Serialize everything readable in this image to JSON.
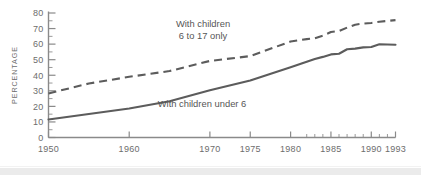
{
  "chart_data": {
    "type": "line",
    "title": "",
    "subtitle": "",
    "xlabel": "",
    "ylabel": "PERCENTAGE",
    "xlim": [
      1950,
      1993
    ],
    "ylim": [
      0,
      80
    ],
    "grid": false,
    "legend_position": "inline-annotations",
    "y_ticks": [
      0,
      10,
      20,
      30,
      40,
      50,
      60,
      70,
      80
    ],
    "y_tick_labels": [
      "0",
      "10",
      "20",
      "30",
      "40",
      "50",
      "60",
      "70",
      "80"
    ],
    "y_minor_ticks": [
      5,
      15,
      25,
      35,
      45,
      55,
      65,
      75
    ],
    "x_ticks": [
      1950,
      1960,
      1970,
      1975,
      1980,
      1985,
      1990,
      1993
    ],
    "x_tick_labels": [
      "1950",
      "1960",
      "1970",
      "1975",
      "1980",
      "1985",
      "1990",
      "1993"
    ],
    "x_minor_ticks": [
      1982,
      1983,
      1984,
      1986,
      1987,
      1988,
      1989,
      1991,
      1992
    ],
    "series": [
      {
        "name": "With children 6 to 17 only",
        "style": "dashed",
        "color": "#5c5c5c",
        "x": [
          1950,
          1955,
          1960,
          1965,
          1970,
          1975,
          1980,
          1982,
          1983,
          1984,
          1985,
          1986,
          1987,
          1988,
          1989,
          1990,
          1991,
          1992,
          1993
        ],
        "values": [
          28.3,
          34.7,
          39.0,
          42.7,
          49.2,
          52.3,
          61.7,
          63.2,
          63.8,
          65.4,
          67.8,
          68.4,
          70.6,
          72.5,
          73.2,
          73.6,
          74.4,
          74.9,
          75.4
        ]
      },
      {
        "name": "With children under 6",
        "style": "solid",
        "color": "#5c5c5c",
        "x": [
          1950,
          1955,
          1960,
          1965,
          1970,
          1975,
          1980,
          1982,
          1983,
          1984,
          1985,
          1986,
          1987,
          1988,
          1989,
          1990,
          1991,
          1992,
          1993
        ],
        "values": [
          11.6,
          15.1,
          18.6,
          23.3,
          30.3,
          36.6,
          45.1,
          48.7,
          50.5,
          51.8,
          53.4,
          53.8,
          56.7,
          57.1,
          57.9,
          58.2,
          59.9,
          59.8,
          59.6
        ]
      }
    ],
    "annotations": [
      {
        "name": "annotation-children-6-to-17",
        "lines": [
          "With children",
          "6 to 17 only"
        ],
        "x_px": 203,
        "y_px": 27
      },
      {
        "name": "annotation-children-under-6",
        "lines": [
          "With children under 6"
        ],
        "x_px": 202,
        "y_px": 107
      }
    ]
  }
}
